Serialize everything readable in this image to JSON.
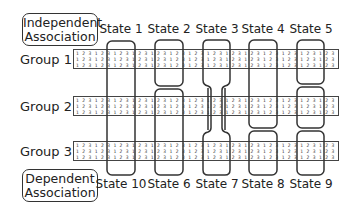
{
  "associations": {
    "independent": {
      "line1": "Independent",
      "line2": "Association"
    },
    "dependent": {
      "line1": "Dependent",
      "line2": "Association"
    }
  },
  "groups": [
    {
      "label": "Group 1",
      "rows": [
        "1 2 3 1 2 3 1 2 3 1 2 3 1 2 3 1 2 3 1 2 3 1 2 3 1 2 3 1 2 3 1 2 3 1 2 3 1 2 3 1 2 3 1 2 3 1 2 3 1 2 3 1 2 3 1 2 3 1 2 3 1 2 3 1 2 3",
        "1 2 3 1 2 3 1 2 3 1 2 3 1 2 3 1 2 3 1 2 3 1 2 3 1 2 3 1 2 3 1 2 3 1 2 3 1 2 3 1 2 3 1 2 3 1 2 3 1 2 3 1 2 3 1 2 3 1 2 3 1 2 3 1 2 3",
        "1 2 3 1 2 3 1 2 3 1 2 3 1 2 3 1 2 3 1 2 3 1 2 3 1 2 3 1 2 3 1 2 3 1 2 3 1 2 3 1 2 3 1 2 3 1 2 3 1 2 3 1 2 3 1 2 3 1 2 3 1 2 3 1 2 3"
      ]
    },
    {
      "label": "Group 2",
      "rows": [
        "1 2 3 1 2 3 1 2 3 1 2 3 1 2 3 1 2 3 1 2 3 1 2 3 1 2 3 1 2 3 1 2 3 1 2 3 1 2 3 1 2 3 1 2 3 1 2 3 1 2 3 1 2 3 1 2 3 1 2 3 1 2 3 1 2 3",
        "1 2 3 1 2 3 1 2 3 1 2 3 1 2 3 1 2 3 1 2 3 1 2 3 1 2 3 1 2 3 1 2 3 1 2 3 1 2 3 1 2 3 1 2 3 1 2 3 1 2 3 1 2 3 1 2 3 1 2 3 1 2 3 1 2 3",
        "1 2 3 1 2 3 1 2 3 1 2 3 1 2 3 1 2 3 1 2 3 1 2 3 1 2 3 1 2 3 1 2 3 1 2 3 1 2 3 1 2 3 1 2 3 1 2 3 1 2 3 1 2 3 1 2 3 1 2 3 1 2 3 1 2 3"
      ]
    },
    {
      "label": "Group 3",
      "rows": [
        "1 2 3 1 2 3 1 2 3 1 2 3 1 2 3 1 2 3 1 2 3 1 2 3 1 2 3 1 2 3 1 2 3 1 2 3 1 2 3 1 2 3 1 2 3 1 2 3 1 2 3 1 2 3 1 2 3 1 2 3 1 2 3 1 2 3",
        "1 2 3 1 2 3 1 2 3 1 2 3 1 2 3 1 2 3 1 2 3 1 2 3 1 2 3 1 2 3 1 2 3 1 2 3 1 2 3 1 2 3 1 2 3 1 2 3 1 2 3 1 2 3 1 2 3 1 2 3 1 2 3 1 2 3",
        "1 2 3 1 2 3 1 2 3 1 2 3 1 2 3 1 2 3 1 2 3 1 2 3 1 2 3 1 2 3 1 2 3 1 2 3 1 2 3 1 2 3 1 2 3 1 2 3 1 2 3 1 2 3 1 2 3 1 2 3 1 2 3 1 2 3"
      ]
    }
  ],
  "states_top": [
    "State 1",
    "State 2",
    "State 3",
    "State 4",
    "State 5"
  ],
  "states_bottom": [
    "State 10",
    "State 6",
    "State 7",
    "State 8",
    "State 9"
  ],
  "colors": {
    "outline": "#333333",
    "text": "#222222",
    "background": "#ffffff"
  }
}
